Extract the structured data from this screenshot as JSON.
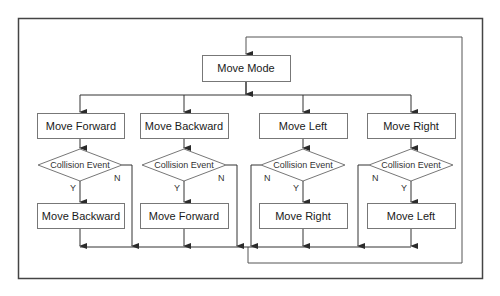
{
  "diagram": {
    "type": "flowchart",
    "colors": {
      "line": "#3a3a3a",
      "box_border": "#777777",
      "background": "#ffffff",
      "frame": "#444444"
    },
    "start": {
      "label": "Move  Mode"
    },
    "branches": [
      {
        "action": "Move Forward",
        "decision": "Collision Event",
        "yes_action": "Move Backward",
        "yes_label": "Y",
        "no_label": "N"
      },
      {
        "action": "Move Backward",
        "decision": "Collision Event",
        "yes_action": "Move Forward",
        "yes_label": "Y",
        "no_label": "N"
      },
      {
        "action": "Move Left",
        "decision": "Collision Event",
        "yes_action": "Move Right",
        "yes_label": "Y",
        "no_label": "N"
      },
      {
        "action": "Move Right",
        "decision": "Collision Event",
        "yes_action": "Move Left",
        "yes_label": "Y",
        "no_label": "N"
      }
    ]
  }
}
